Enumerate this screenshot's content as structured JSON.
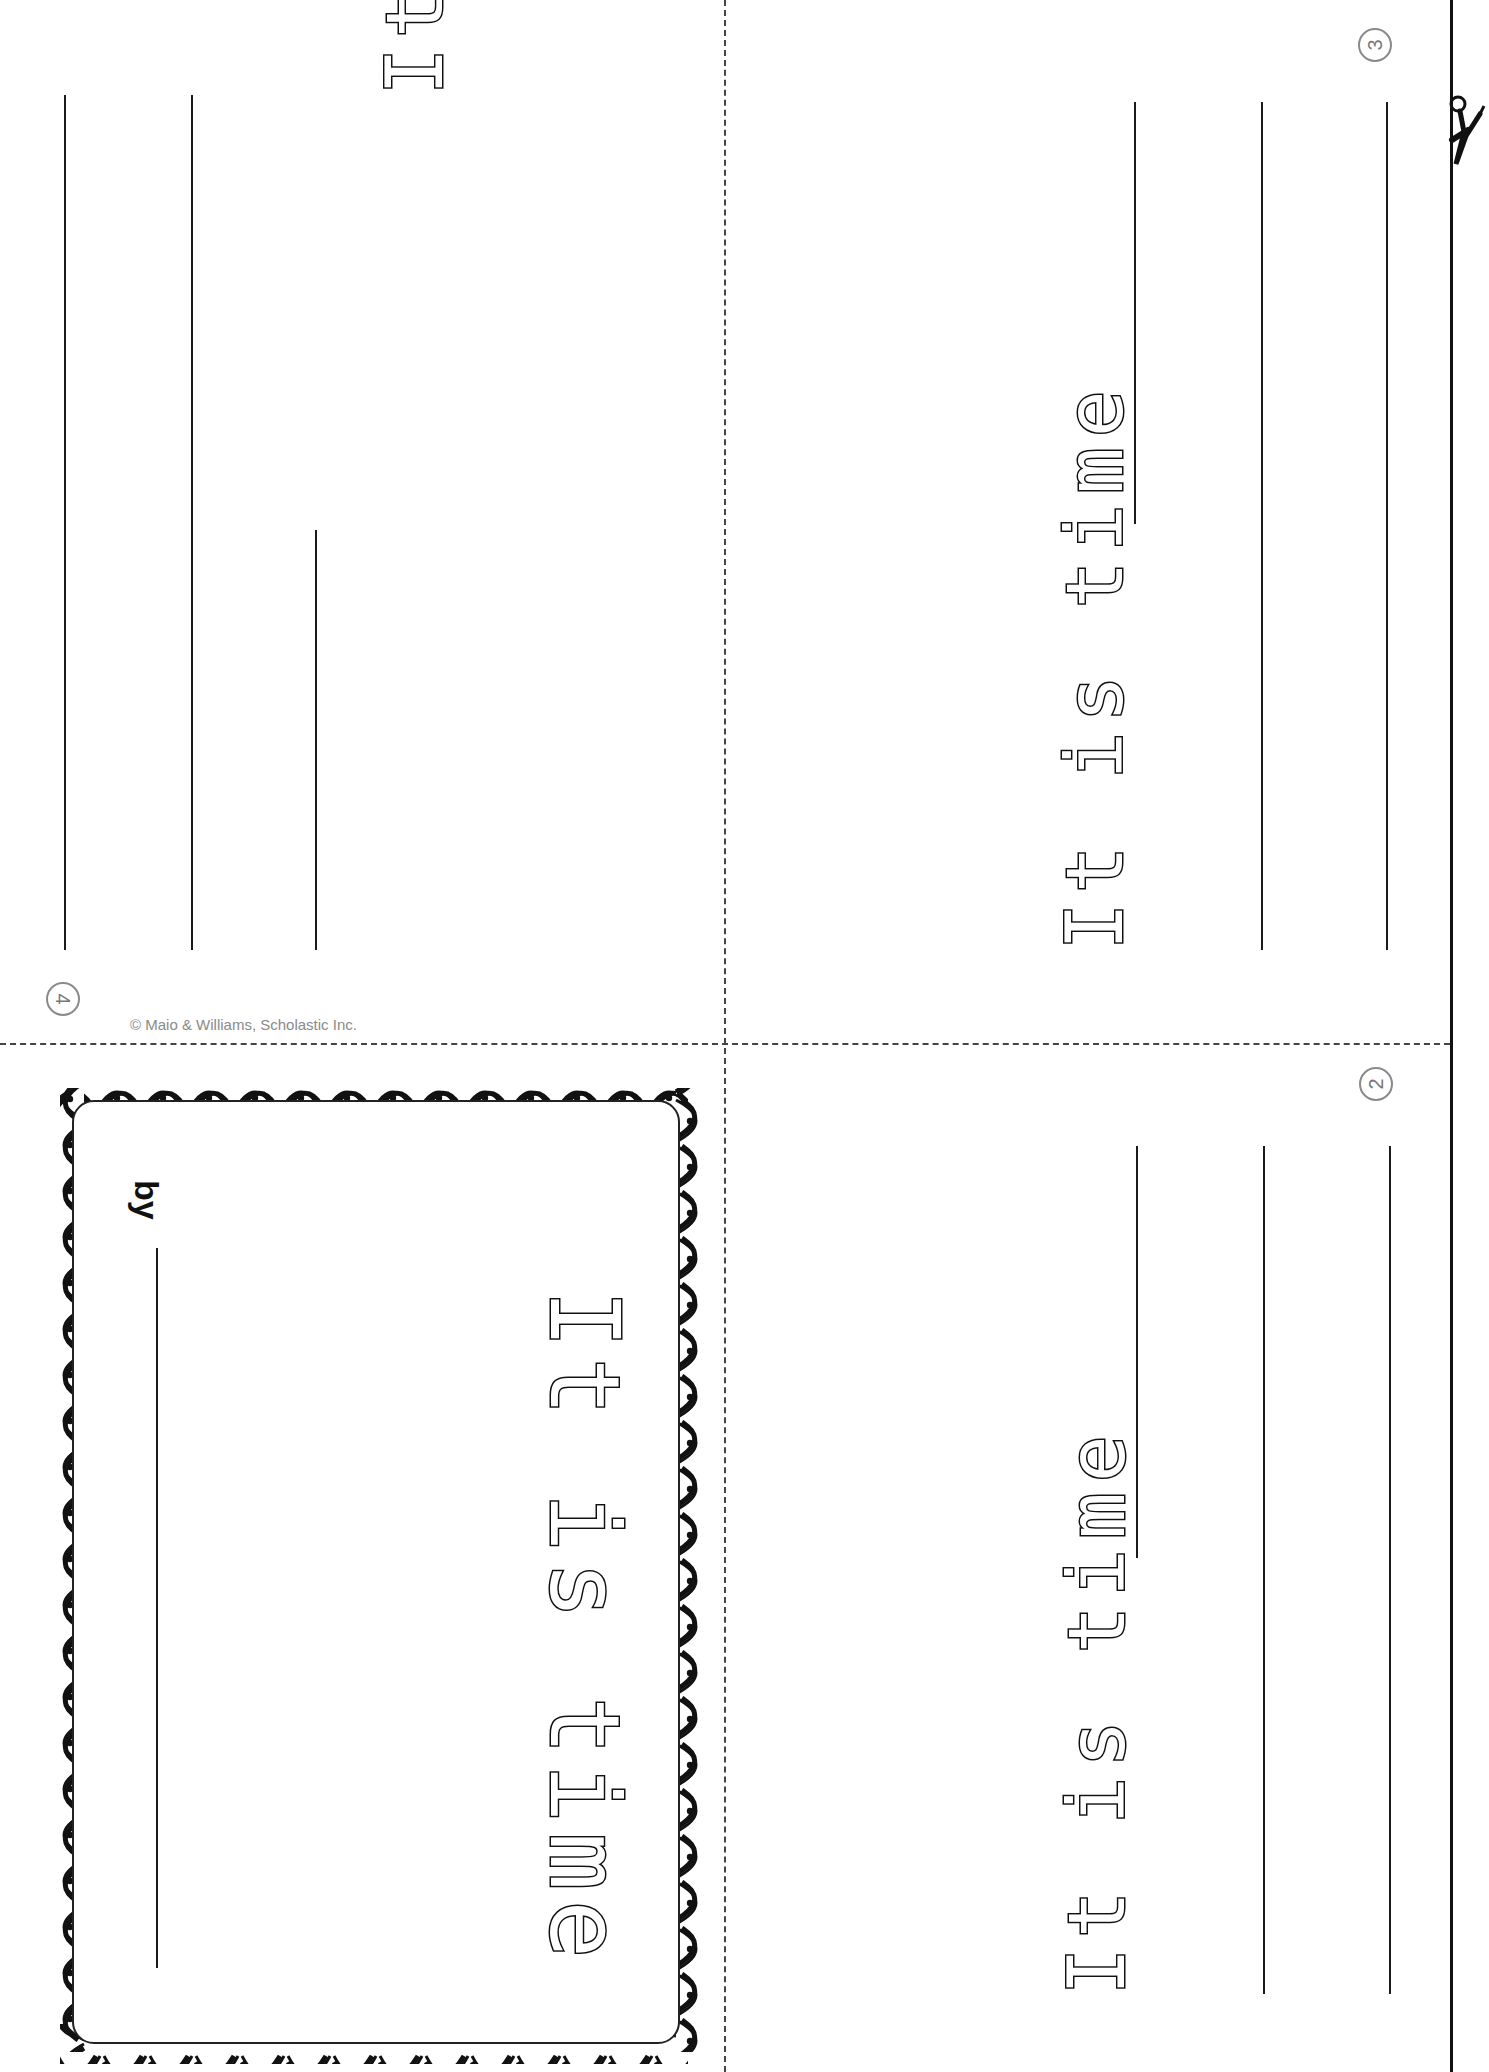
{
  "worksheet": {
    "title": "It is time",
    "cover": {
      "title": "It is time",
      "byline_label": "by",
      "copyright": "© Maio & Williams, Scholastic Inc."
    },
    "pages": [
      {
        "number": "4",
        "prompt": "It is time",
        "position": "top-left",
        "orientation": "upside-down"
      },
      {
        "number": "3",
        "prompt": "It is time",
        "position": "top-right",
        "orientation": "rotated"
      },
      {
        "number": "2",
        "prompt": "It is time",
        "position": "bottom-right",
        "orientation": "rotated"
      }
    ],
    "cut_guides": {
      "vertical_dashed": "fold/cut line",
      "horizontal_dashed": "fold/cut line",
      "solid_edge": "cut line with scissors"
    },
    "colors": {
      "ink": "#111111",
      "dashed_guide": "#444444",
      "page_number": "#8a8a8a",
      "paper": "#ffffff"
    }
  }
}
